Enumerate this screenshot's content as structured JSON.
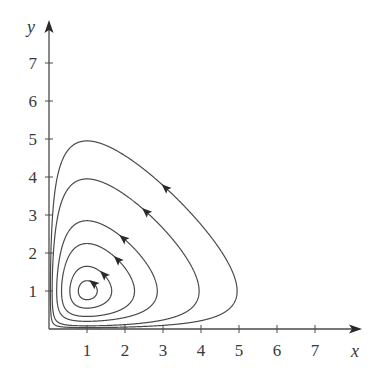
{
  "chart_data": {
    "type": "line",
    "title": "",
    "subtitle": "Phase portrait: closed orbits around equilibrium (1, 1)",
    "xlabel": "x",
    "ylabel": "y",
    "xlim": [
      0,
      8
    ],
    "ylim": [
      0,
      8
    ],
    "x_ticks": [
      1,
      2,
      3,
      4,
      5,
      6,
      7
    ],
    "y_ticks": [
      1,
      2,
      3,
      4,
      5,
      6,
      7
    ],
    "x_tick_labels": [
      "1",
      "2",
      "3",
      "4",
      "5",
      "6",
      "7"
    ],
    "y_tick_labels": [
      "1",
      "2",
      "3",
      "4",
      "5",
      "6",
      "7"
    ],
    "grid": false,
    "legend": null,
    "equilibrium": {
      "x": 1,
      "y": 1
    },
    "model": "level sets of V(x,y) = x - ln x + y - ln y",
    "direction": "counterclockwise",
    "series": [
      {
        "name": "orbit-1",
        "y_max": 1.27,
        "x_max": 1.27,
        "arrow": {
          "x": 1.13,
          "y": 1.17
        }
      },
      {
        "name": "orbit-2",
        "y_max": 1.65,
        "x_max": 1.65,
        "arrow": {
          "x": 1.45,
          "y": 1.45
        }
      },
      {
        "name": "orbit-3",
        "y_max": 2.25,
        "x_max": 2.25,
        "arrow": {
          "x": 1.85,
          "y": 1.88
        }
      },
      {
        "name": "orbit-4",
        "y_max": 2.85,
        "x_max": 2.85,
        "arrow": {
          "x": 2.0,
          "y": 2.45
        }
      },
      {
        "name": "orbit-5",
        "y_max": 3.95,
        "x_max": 3.95,
        "arrow": {
          "x": 2.55,
          "y": 3.1
        }
      },
      {
        "name": "orbit-6",
        "y_max": 4.95,
        "x_max": 4.95,
        "arrow": {
          "x": 3.05,
          "y": 3.7
        }
      }
    ]
  },
  "axes": {
    "x_label": "x",
    "y_label": "y",
    "origin_px": {
      "x": 49,
      "y": 329
    },
    "unit_px": 38,
    "x_axis_end_px": 362,
    "y_axis_end_px": 20
  },
  "colors": {
    "curve": "#4a4a4a",
    "axis": "#4a4a4a",
    "text": "#3a3a3a",
    "background": "#ffffff"
  }
}
